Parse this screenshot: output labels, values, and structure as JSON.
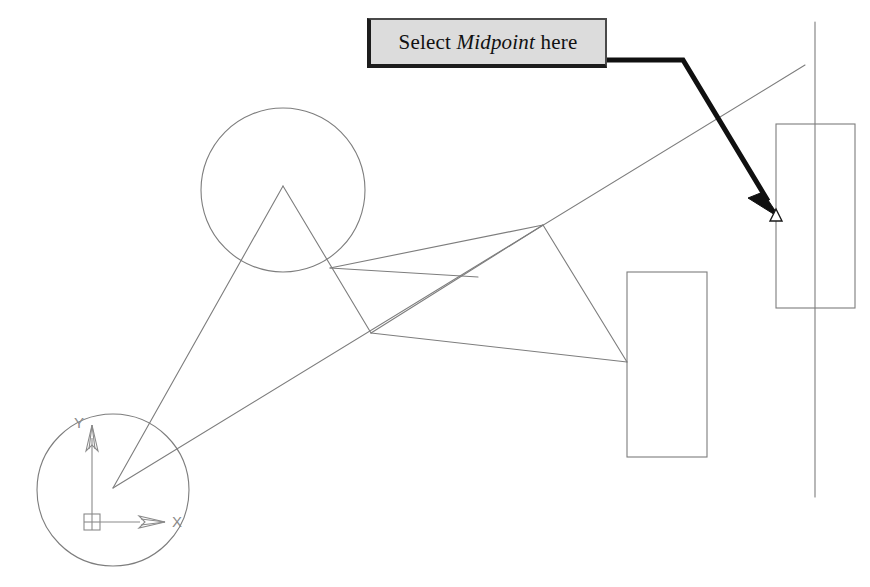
{
  "figure": {
    "kind": "cad-drawing-illustration",
    "width": 870,
    "height": 587,
    "background_color": "#ffffff"
  },
  "callout": {
    "text_before": "Select ",
    "keyword": "Midpoint",
    "text_after": " here",
    "full_text": "Select Midpoint here",
    "fill_color": "#dcdcdc",
    "border_color": "#1c1c1c",
    "text_color": "#111111",
    "box": {
      "x": 367,
      "y": 18,
      "width": 240,
      "height": 50
    }
  },
  "leader_arrow": {
    "name": "callout-leader-arrow",
    "color": "#101010",
    "stroke_width": 5,
    "points": "607,60 683,60 772,208",
    "head_tip": {
      "x": 778,
      "y": 215
    }
  },
  "snap_marker": {
    "type": "midpoint",
    "shape": "open-triangle",
    "color": "#1a1a1a",
    "x": 776,
    "y": 216,
    "size": 11
  },
  "geometry": {
    "line_color": "#7d7d7d",
    "line_width": 1,
    "circles": [
      {
        "name": "lower-left-circle",
        "cx": 113,
        "cy": 490,
        "r": 76
      },
      {
        "name": "upper-circle",
        "cx": 283,
        "cy": 190,
        "r": 82
      }
    ],
    "rectangles": [
      {
        "name": "middle-rectangle",
        "x": 627,
        "y": 272,
        "width": 80,
        "height": 185
      },
      {
        "name": "right-rectangle",
        "x": 776,
        "y": 124,
        "width": 79,
        "height": 184
      }
    ],
    "vertical_line": {
      "name": "vertical-construction-line",
      "x": 815,
      "y1": 22,
      "y2": 497
    },
    "polylines": [
      {
        "name": "long-diagonal",
        "points": "113,488 805,65"
      },
      {
        "name": "triangle-left-leg",
        "points": "283,186 113,488"
      },
      {
        "name": "triangle-right-leg",
        "points": "283,186 371,333"
      },
      {
        "name": "junction-to-crossing",
        "points": "371,333 543,225"
      },
      {
        "name": "crossing-to-rect",
        "points": "543,225 627,362"
      },
      {
        "name": "junction-to-rect",
        "points": "371,333 627,362"
      },
      {
        "name": "upper-chord",
        "points": "330,268 478,277"
      },
      {
        "name": "circle-tangent-upper",
        "points": "330,268 543,225"
      }
    ]
  },
  "ucs_icon": {
    "name": "ucs-coordinate-icon",
    "color": "#8a8a8a",
    "origin_box": {
      "x": 84,
      "y": 514,
      "width": 16,
      "height": 16
    },
    "y_axis": {
      "x": 92,
      "y_from": 522,
      "y_to": 425,
      "label": "Y"
    },
    "x_axis": {
      "y": 522,
      "x_from": 92,
      "x_to": 165,
      "label": "X"
    }
  }
}
